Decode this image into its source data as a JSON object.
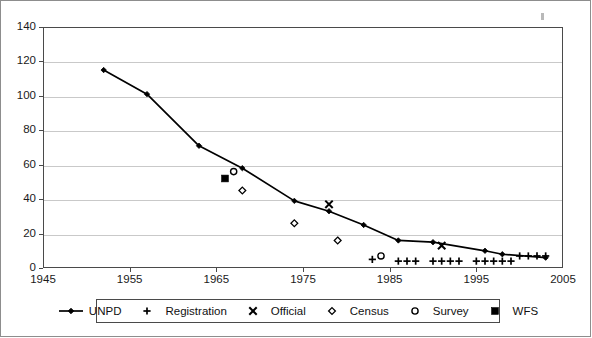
{
  "chart_data": {
    "type": "scatter",
    "title": "",
    "subtitle": "",
    "xlabel": "",
    "ylabel": "",
    "xlim": [
      1945,
      2005
    ],
    "ylim": [
      0,
      140
    ],
    "xticks": [
      1945,
      1955,
      1965,
      1975,
      1985,
      1995,
      2005
    ],
    "yticks": [
      0,
      20,
      40,
      60,
      80,
      100,
      120,
      140
    ],
    "grid": "horizontal",
    "legend_position": "below-axes",
    "series": [
      {
        "name": "UNPD",
        "marker": "filled-diamond",
        "line": true,
        "points": [
          [
            1952,
            115
          ],
          [
            1957,
            101
          ],
          [
            1963,
            71
          ],
          [
            1968,
            58
          ],
          [
            1974,
            39
          ],
          [
            1978,
            33
          ],
          [
            1982,
            25
          ],
          [
            1986,
            16
          ],
          [
            1990,
            15
          ],
          [
            1996,
            10
          ],
          [
            1998,
            8
          ],
          [
            2003,
            6
          ]
        ]
      },
      {
        "name": "Registration",
        "marker": "plus",
        "line": false,
        "points": [
          [
            1983,
            5
          ],
          [
            1986,
            4
          ],
          [
            1987,
            4
          ],
          [
            1988,
            4
          ],
          [
            1990,
            4
          ],
          [
            1991,
            4
          ],
          [
            1992,
            4
          ],
          [
            1993,
            4
          ],
          [
            1995,
            4
          ],
          [
            1996,
            4
          ],
          [
            1997,
            4
          ],
          [
            1998,
            4
          ],
          [
            1999,
            4
          ],
          [
            2000,
            7
          ],
          [
            2001,
            7
          ],
          [
            2002,
            7
          ],
          [
            2003,
            7
          ]
        ]
      },
      {
        "name": "Official",
        "marker": "cross",
        "line": false,
        "points": [
          [
            1978,
            37
          ],
          [
            1991,
            13
          ]
        ]
      },
      {
        "name": "Census",
        "marker": "open-diamond",
        "line": false,
        "points": [
          [
            1968,
            45
          ],
          [
            1974,
            26
          ],
          [
            1979,
            16
          ]
        ]
      },
      {
        "name": "Survey",
        "marker": "open-circle",
        "line": false,
        "points": [
          [
            1967,
            56
          ],
          [
            1984,
            7
          ]
        ]
      },
      {
        "name": "WFS",
        "marker": "filled-square",
        "line": false,
        "points": [
          [
            1966,
            52
          ]
        ]
      }
    ]
  },
  "axes": {
    "y_tick_labels": [
      "140",
      "120",
      "100",
      "80",
      "60",
      "40",
      "20",
      "0"
    ],
    "x_tick_labels": [
      "1945",
      "1955",
      "1965",
      "1975",
      "1985",
      "1995",
      "2005"
    ]
  },
  "legend": {
    "entries": [
      {
        "label": "UNPD",
        "marker": "filled-diamond-line"
      },
      {
        "label": "Registration",
        "marker": "plus"
      },
      {
        "label": "Official",
        "marker": "cross"
      },
      {
        "label": "Census",
        "marker": "open-diamond"
      },
      {
        "label": "Survey",
        "marker": "open-circle"
      },
      {
        "label": "WFS",
        "marker": "filled-square"
      }
    ]
  },
  "colors": {
    "series": "#000000",
    "grid": "#c9c9c9",
    "axis": "#4a4a4a",
    "background": "#ffffff"
  }
}
